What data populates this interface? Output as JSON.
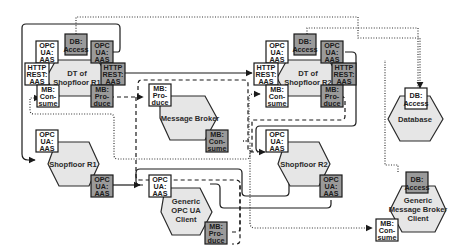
{
  "nodes": {
    "dt_r1": {
      "label_line1": "DT of",
      "label_line2": "Shopfloor R1"
    },
    "dt_r2": {
      "label_line1": "DT of",
      "label_line2": "Shopfloor R2"
    },
    "message_broker": {
      "label": "Message Broker"
    },
    "database": {
      "label": "Database"
    },
    "shopfloor_r1": {
      "label": "Shopfloor R1"
    },
    "shopfloor_r2": {
      "label": "Shopfloor R2"
    },
    "generic_opcua_client": {
      "label_line1": "Generic",
      "label_line2": "OPC UA",
      "label_line3": "Client"
    },
    "generic_mb_client": {
      "label_line1": "Generic",
      "label_line2": "Message Broker",
      "label_line3": "Client"
    }
  },
  "ports": {
    "opc": {
      "l1": "OPC",
      "l2": "UA:",
      "l3": "AAS"
    },
    "db": {
      "l1": "DB:",
      "l2": "Access"
    },
    "http": {
      "l1": "HTTP",
      "l2": "REST:",
      "l3": "AAS"
    },
    "mb_consume": {
      "l1": "MB:",
      "l2": "Con-",
      "l3": "sume"
    },
    "mb_produce": {
      "l1": "MB:",
      "l2": "Pro-",
      "l3": "duce"
    }
  },
  "colors": {
    "hexagon_fill": "#e6e6e6",
    "server_port_fill": "#9a9a9a",
    "client_port_fill": "#ffffff",
    "line": "#1a1a1a"
  },
  "legend_line_styles": [
    "solid",
    "dashed",
    "dotted"
  ]
}
